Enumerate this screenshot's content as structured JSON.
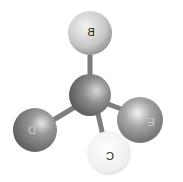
{
  "diagram": {
    "type": "tetrahedral-molecule-ball-and-stick",
    "center_atom": {
      "label": "",
      "color": "#7a7a7a"
    },
    "atoms": [
      {
        "position": "top",
        "label": "B",
        "color": "#c8c8c8"
      },
      {
        "position": "left",
        "label": "D",
        "color": "#8a8a8a"
      },
      {
        "position": "right",
        "label": "E",
        "color": "#9a9a9a"
      },
      {
        "position": "front",
        "label": "C",
        "color": "#efefef"
      }
    ],
    "bond_color": "#7d7d7d"
  }
}
